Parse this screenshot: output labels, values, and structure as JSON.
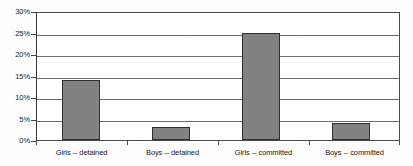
{
  "chart_data": {
    "type": "bar",
    "title": "",
    "subtitle": "",
    "xlabel": "",
    "ylabel": "",
    "categories": [
      "Girls -- detained",
      "Boys -- detained",
      "Girls -- committed",
      "Boys -- committed"
    ],
    "values": [
      14.1,
      3.0,
      25.2,
      4.1
    ],
    "value_labels": [
      "14.1%",
      "3.0%",
      "25.2%",
      "4.1%"
    ],
    "ylim": [
      0,
      30
    ],
    "ytick_values": [
      0,
      5,
      10,
      15,
      20,
      25,
      30
    ],
    "ytick_labels": [
      "0%",
      "5%",
      "10%",
      "15%",
      "20%",
      "25%",
      "30%"
    ],
    "grid": "horizontal",
    "legend": "none",
    "series": [
      {
        "name": "",
        "values": [
          14.1,
          3.0,
          25.2,
          4.1
        ]
      }
    ],
    "colors": {
      "bar_fill": "#828282",
      "bar_border": "#2e2e2e",
      "gridline": "#6b6b6b",
      "axis": "#3a3a3a",
      "text": "#1a1a1a",
      "background": "#ffffff"
    }
  }
}
